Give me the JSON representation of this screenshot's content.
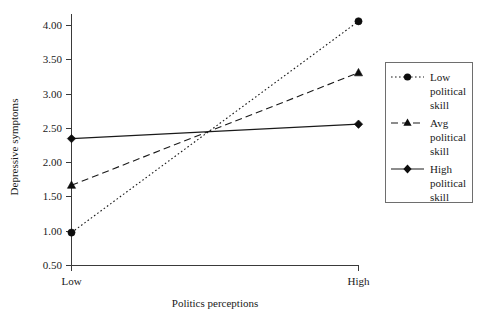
{
  "chart_data": {
    "type": "line",
    "title": "",
    "xlabel": "Politics perceptions",
    "ylabel": "Depressive symptoms",
    "categories": [
      "Low",
      "High"
    ],
    "x": [
      0,
      1
    ],
    "ylim": [
      0.5,
      4.0
    ],
    "yticks": [
      "0.50",
      "1.00",
      "1.50",
      "2.00",
      "2.50",
      "3.00",
      "3.50",
      "4.00"
    ],
    "ytick_values": [
      0.5,
      1.0,
      1.5,
      2.0,
      2.5,
      3.0,
      3.5,
      4.0
    ],
    "grid": false,
    "legend_position": "right",
    "series": [
      {
        "name": "Low political skill",
        "name_lines": [
          "Low",
          "political",
          "skill"
        ],
        "values": [
          0.98,
          4.06
        ],
        "line_style": "dotted",
        "marker": "circle",
        "color": "#1a1a1a"
      },
      {
        "name": "Avg political skill",
        "name_lines": [
          "Avg",
          "political",
          "skill"
        ],
        "values": [
          1.67,
          3.31
        ],
        "line_style": "dashed",
        "marker": "triangle",
        "color": "#1a1a1a"
      },
      {
        "name": "High political skill",
        "name_lines": [
          "High",
          "political",
          "skill"
        ],
        "values": [
          2.35,
          2.56
        ],
        "line_style": "solid",
        "marker": "diamond",
        "color": "#1a1a1a"
      }
    ]
  },
  "axes": {
    "y_title": "Depressive symptoms",
    "x_title": "Politics perceptions",
    "x_cat_low": "Low",
    "x_cat_high": "High",
    "ytick_0": "0.50",
    "ytick_1": "1.00",
    "ytick_2": "1.50",
    "ytick_3": "2.00",
    "ytick_4": "2.50",
    "ytick_5": "3.00",
    "ytick_6": "3.50",
    "ytick_7": "4.00"
  },
  "legend": {
    "entries": [
      {
        "l0": "Low",
        "l1": "political",
        "l2": "skill"
      },
      {
        "l0": "Avg",
        "l1": "political",
        "l2": "skill"
      },
      {
        "l0": "High",
        "l1": "political",
        "l2": "skill"
      }
    ]
  }
}
